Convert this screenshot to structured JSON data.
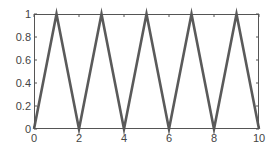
{
  "chart_data": {
    "type": "line",
    "title": "",
    "xlabel": "",
    "ylabel": "",
    "xlim": [
      0,
      10
    ],
    "ylim": [
      0,
      1
    ],
    "grid": false,
    "legend": null,
    "x_ticks": [
      0,
      2,
      4,
      6,
      8,
      10
    ],
    "x_tick_labels": [
      "0",
      "2",
      "4",
      "6",
      "8",
      "10"
    ],
    "y_ticks": [
      0,
      0.2,
      0.4,
      0.6,
      0.8,
      1
    ],
    "y_tick_labels": [
      "0",
      "0.2",
      "0.4",
      "0.6",
      "0.8",
      "1"
    ],
    "series": [
      {
        "name": "triangle wave",
        "color": "#5a5a5a",
        "x": [
          0,
          1,
          2,
          3,
          4,
          5,
          6,
          7,
          8,
          9,
          10
        ],
        "y": [
          0,
          1,
          0,
          1,
          0,
          1,
          0,
          1,
          0,
          1,
          0
        ]
      }
    ]
  },
  "colors": {
    "axis": "#555555",
    "line": "#5a5a5a",
    "background": "#ffffff"
  }
}
